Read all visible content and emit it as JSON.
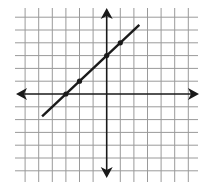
{
  "chart_data": {
    "type": "line",
    "title": "",
    "xlabel": "",
    "ylabel": "",
    "equation": "y = x + 3",
    "grid": true,
    "axes_arrows": true,
    "xlim": [
      -6,
      6
    ],
    "ylim": [
      -6,
      6
    ],
    "tick_labels_shown": false,
    "series": [
      {
        "name": "line",
        "slope": 1,
        "intercept": 3,
        "segment": {
          "x_start": -4.75,
          "x_end": 2.4
        },
        "marked_points": [
          {
            "x": -3,
            "y": 0
          },
          {
            "x": -2,
            "y": 1
          },
          {
            "x": 0,
            "y": 3
          },
          {
            "x": 1,
            "y": 4
          }
        ]
      }
    ],
    "colors": {
      "grid": "#9a9a9a",
      "axes": "#1a1a1a",
      "line": "#1a1a1a",
      "background": "#ffffff"
    }
  }
}
